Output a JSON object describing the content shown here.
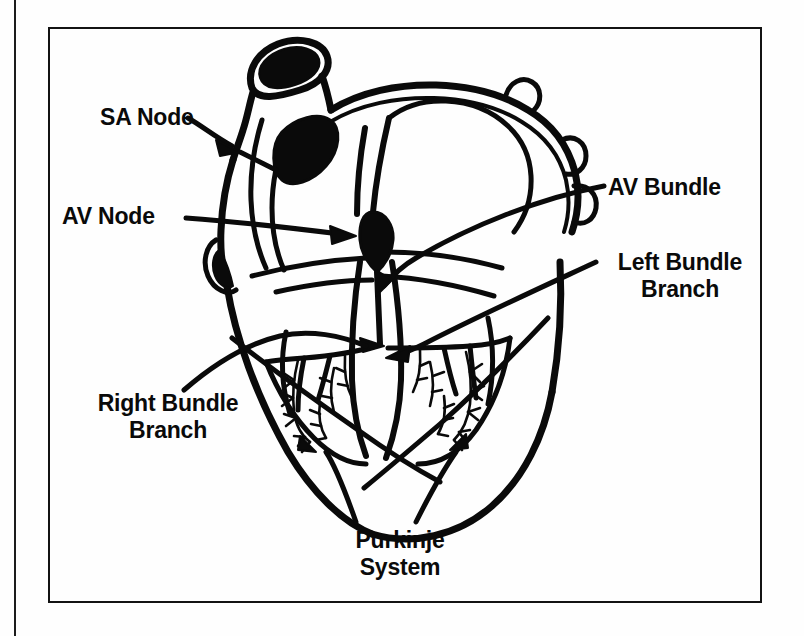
{
  "figure": {
    "background_color": "#ffffff",
    "ink_color": "#0a0a0a",
    "frame": {
      "x": 48,
      "y": 27,
      "width": 714,
      "height": 576
    }
  },
  "labels": {
    "sa_node": "SA Node",
    "av_node": "AV Node",
    "av_bundle": "AV Bundle",
    "left_bundle_branch_line1": "Left Bundle",
    "left_bundle_branch_line2": "Branch",
    "right_bundle_branch_line1": "Right Bundle",
    "right_bundle_branch_line2": "Branch",
    "purkinje_line1": "Purkinje",
    "purkinje_line2": "System"
  },
  "structures": [
    {
      "name": "sa-node",
      "kind": "filled-ellipse",
      "description": "Sinoatrial node, dark oval in right atrium wall"
    },
    {
      "name": "av-node",
      "kind": "filled-teardrop",
      "description": "Atrioventricular node, dark teardrop at center septum"
    },
    {
      "name": "av-bundle",
      "kind": "line",
      "description": "Bundle of His descending from AV node into septum"
    },
    {
      "name": "left-bundle-branch",
      "kind": "branching-line",
      "description": "Left bundle branch fanning into left ventricle"
    },
    {
      "name": "right-bundle-branch",
      "kind": "branching-line",
      "description": "Right bundle branch fanning into right ventricle"
    },
    {
      "name": "purkinje-system",
      "kind": "branching-fibers",
      "description": "Purkinje fibers arborizing through ventricular walls"
    },
    {
      "name": "superior-vena-cava",
      "kind": "vessel",
      "description": "Great vessel at top left of heart"
    },
    {
      "name": "heart-outline",
      "kind": "outline",
      "description": "Outer myocardial wall of heart"
    }
  ]
}
